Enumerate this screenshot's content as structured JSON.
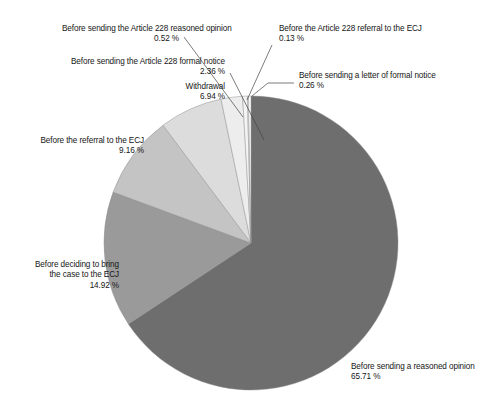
{
  "chart_data": {
    "type": "pie",
    "title": "",
    "subtitle": "",
    "xlabel": "",
    "ylabel": "",
    "legend_position": "callout-labels",
    "grid": false,
    "unit": "%",
    "start_angle_deg": 0,
    "direction": "clockwise",
    "center": {
      "x": 251,
      "y": 243,
      "r": 147
    },
    "categories": [
      "Before sending a reasoned opinion",
      "Before deciding to bring the case to the ECJ",
      "Before the referral to the ECJ",
      "Withdrawal",
      "Before sending the Article 228 formal notice",
      "Before sending the Article 228 reasoned opinion",
      "Before the Article 228 referral to the ECJ",
      "Before sending a letter of formal notice"
    ],
    "values": [
      65.71,
      14.92,
      9.16,
      6.94,
      2.36,
      0.52,
      0.13,
      0.26
    ],
    "colors": [
      "#6e6e6e",
      "#9a9a9a",
      "#c4c4c4",
      "#dcdcdc",
      "#ededed",
      "#f4f4f4",
      "#fafafa",
      "#ffffff"
    ],
    "slices": [
      {
        "label": "Before sending a reasoned opinion",
        "value": 65.71,
        "value_text": "65.71 %",
        "color": "#6e6e6e"
      },
      {
        "label": "Before deciding to bring the case to the ECJ",
        "value": 14.92,
        "value_text": "14.92 %",
        "color": "#9a9a9a"
      },
      {
        "label": "Before the referral to the ECJ",
        "value": 9.16,
        "value_text": "9.16 %",
        "color": "#c4c4c4"
      },
      {
        "label": "Withdrawal",
        "value": 6.94,
        "value_text": "6.94 %",
        "color": "#dcdcdc"
      },
      {
        "label": "Before sending the Article 228 formal notice",
        "value": 2.36,
        "value_text": "2.36 %",
        "color": "#ededed"
      },
      {
        "label": "Before sending the Article 228 reasoned opinion",
        "value": 0.52,
        "value_text": "0.52 %",
        "color": "#f4f4f4"
      },
      {
        "label": "Before the Article 228 referral to the ECJ",
        "value": 0.13,
        "value_text": "0.13 %",
        "color": "#fafafa"
      },
      {
        "label": "Before sending a letter of formal notice",
        "value": 0.26,
        "value_text": "0.26 %",
        "color": "#ffffff"
      }
    ]
  },
  "labels": {
    "a228_reasoned_opinion": {
      "text": "Before sending the Article 228 reasoned opinion",
      "value": "0.52 %"
    },
    "a228_referral_ecj": {
      "text": "Before the Article 228 referral to the ECJ",
      "value": "0.13 %"
    },
    "a228_formal_notice": {
      "text": "Before sending the Article 228 formal notice",
      "value": "2.36 %"
    },
    "letter_formal_notice": {
      "text": "Before sending a letter of formal notice",
      "value": "0.26 %"
    },
    "withdrawal": {
      "text": "Withdrawal",
      "value": "6.94 %"
    },
    "referral_ecj": {
      "text": "Before the referral to the ECJ",
      "value": "9.16 %"
    },
    "bring_case_ecj": {
      "text_line1": "Before deciding to bring",
      "text_line2": "the case to the ECJ",
      "value": "14.92 %"
    },
    "reasoned_opinion": {
      "text": "Before sending a reasoned opinion",
      "value": "65.71 %"
    }
  }
}
